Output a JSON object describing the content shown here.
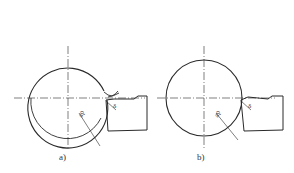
{
  "figure": {
    "panels": [
      {
        "id": "a",
        "caption": "a)",
        "depth_label": "ap",
        "angle_label": "δ",
        "description": "Workpiece circle with machined layer shown as inner concentric arc and chip curling at cutting tool"
      },
      {
        "id": "b",
        "caption": "b)",
        "depth_label": "ap",
        "angle_label": "δ",
        "description": "Workpiece circle in contact with cutting tool, no chip"
      }
    ],
    "colors": {
      "line": "#2a2a2a",
      "background": "#ffffff"
    }
  }
}
